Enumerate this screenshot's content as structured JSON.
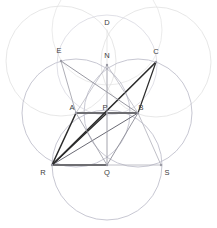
{
  "figure": {
    "background": "#ffffff",
    "width": 217,
    "height": 228
  },
  "palette": {
    "faint_circle": "#d8d8d8",
    "mid_circle": "#b9b9c6",
    "thin_line": "#8c8c96",
    "bold_line": "#2b2b2b",
    "gray_segment": "#6e6e72",
    "label": "#3c3c3c",
    "vertex": "#9a9aa4"
  },
  "points": [
    {
      "id": "D",
      "label": "D",
      "x": 107,
      "y": 30,
      "lx": 107,
      "ly": 25,
      "visible_dot": false
    },
    {
      "id": "E",
      "label": "E",
      "x": 61,
      "y": 61,
      "lx": 59,
      "ly": 53,
      "visible_dot": true
    },
    {
      "id": "N",
      "label": "N",
      "x": 107,
      "y": 65,
      "lx": 107,
      "ly": 58,
      "visible_dot": true
    },
    {
      "id": "C",
      "label": "C",
      "x": 156,
      "y": 62,
      "lx": 156,
      "ly": 54,
      "visible_dot": true
    },
    {
      "id": "A",
      "label": "A",
      "x": 76,
      "y": 113,
      "lx": 72,
      "ly": 110,
      "visible_dot": true
    },
    {
      "id": "P",
      "label": "P",
      "x": 107,
      "y": 113,
      "lx": 105,
      "ly": 110,
      "visible_dot": true
    },
    {
      "id": "B",
      "label": "B",
      "x": 138,
      "y": 113,
      "lx": 141,
      "ly": 110,
      "visible_dot": true
    },
    {
      "id": "R",
      "label": "R",
      "x": 52,
      "y": 165,
      "lx": 43,
      "ly": 175,
      "visible_dot": true
    },
    {
      "id": "Q",
      "label": "Q",
      "x": 107,
      "y": 165,
      "lx": 107,
      "ly": 175,
      "visible_dot": true
    },
    {
      "id": "S",
      "label": "S",
      "x": 161,
      "y": 165,
      "lx": 167,
      "ly": 175,
      "visible_dot": true
    }
  ],
  "circles": [
    {
      "name": "faint-upper-left",
      "cx": 61,
      "cy": 61,
      "r": 55,
      "stroke": "#dcdcdc",
      "width": 0.7
    },
    {
      "name": "faint-upper-right",
      "cx": 156,
      "cy": 62,
      "r": 55,
      "stroke": "#dcdcdc",
      "width": 0.7
    },
    {
      "name": "faint-upper-mid",
      "cx": 107,
      "cy": 30,
      "r": 55,
      "stroke": "#e2e2e2",
      "width": 0.7
    },
    {
      "name": "circle-center-A",
      "cx": 76,
      "cy": 113,
      "r": 54,
      "stroke": "#b9b9c6",
      "width": 0.8
    },
    {
      "name": "circle-center-B",
      "cx": 138,
      "cy": 113,
      "r": 54,
      "stroke": "#b9b9c6",
      "width": 0.8
    },
    {
      "name": "circle-center-Q",
      "cx": 107,
      "cy": 165,
      "r": 55,
      "stroke": "#b9b9c6",
      "width": 0.8
    },
    {
      "name": "circle-center-N",
      "cx": 107,
      "cy": 65,
      "r": 50,
      "stroke": "#d2d2dc",
      "width": 0.7
    }
  ],
  "segments": [
    {
      "name": "seg-A-B",
      "from": "A",
      "to": "B",
      "stroke": "#6e6e72",
      "width": 1.8
    },
    {
      "name": "seg-R-Q",
      "from": "R",
      "to": "Q",
      "stroke": "#6e6e72",
      "width": 1.8
    },
    {
      "name": "seg-R-A",
      "from": "R",
      "to": "A",
      "stroke": "#2b2b2b",
      "width": 1.5
    },
    {
      "name": "seg-R-P",
      "from": "R",
      "to": "P",
      "stroke": "#2b2b2b",
      "width": 1.3
    },
    {
      "name": "seg-R-B",
      "from": "R",
      "to": "B",
      "stroke": "#6a6a74",
      "width": 1.0
    },
    {
      "name": "seg-R-C",
      "from": "R",
      "to": "C",
      "stroke": "#2b2b2b",
      "width": 1.6
    },
    {
      "name": "seg-C-B",
      "from": "C",
      "to": "B",
      "stroke": "#2b2b2b",
      "width": 1.2
    },
    {
      "name": "seg-E-B",
      "from": "E",
      "to": "B",
      "stroke": "#8c8c96",
      "width": 0.9
    },
    {
      "name": "seg-E-A",
      "from": "E",
      "to": "A",
      "stroke": "#9a9aa4",
      "width": 0.8
    },
    {
      "name": "seg-N-Q",
      "from": "N",
      "to": "Q",
      "stroke": "#9a9aa4",
      "width": 0.9
    },
    {
      "name": "seg-Q-B",
      "from": "Q",
      "to": "B",
      "stroke": "#8c8c96",
      "width": 0.9
    },
    {
      "name": "seg-Q-A",
      "from": "Q",
      "to": "A",
      "stroke": "#9a9aa4",
      "width": 0.8
    },
    {
      "name": "seg-Q-S",
      "from": "Q",
      "to": "S",
      "stroke": "#b0b0ba",
      "width": 0.8
    },
    {
      "name": "seg-S-B",
      "from": "S",
      "to": "B",
      "stroke": "#b0b0ba",
      "width": 0.8
    },
    {
      "name": "seg-N-A",
      "from": "N",
      "to": "A",
      "stroke": "#b0b0ba",
      "width": 0.7
    },
    {
      "name": "seg-N-B",
      "from": "N",
      "to": "B",
      "stroke": "#b0b0ba",
      "width": 0.7
    },
    {
      "name": "seg-D-N",
      "from": "D",
      "to": "N",
      "stroke": "#dcdcdc",
      "width": 0.7
    }
  ]
}
